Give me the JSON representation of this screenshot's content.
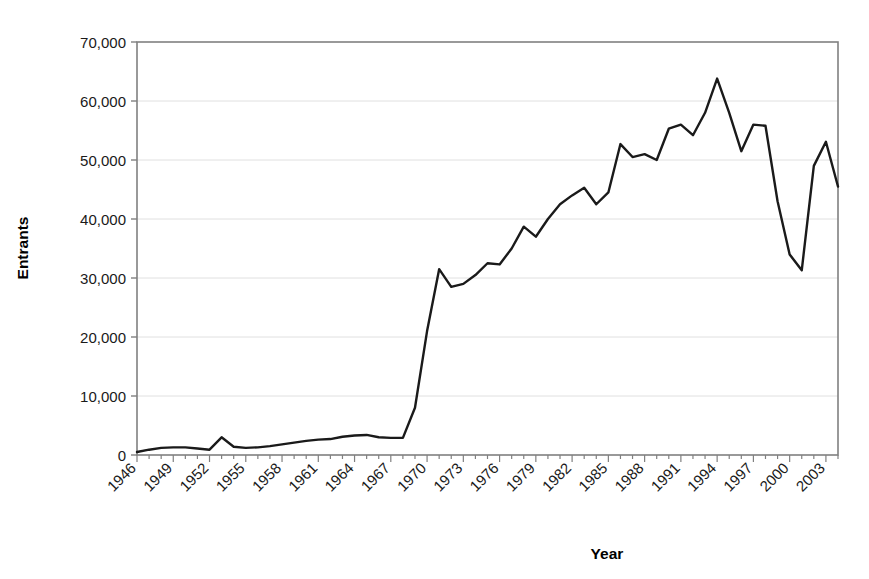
{
  "chart_data": {
    "type": "line",
    "title": "",
    "xlabel": "Year",
    "ylabel": "Entrants",
    "xlim": [
      1946,
      2004
    ],
    "ylim": [
      0,
      70000
    ],
    "grid": "horizontal",
    "legend": "none",
    "ytick_labels": [
      "70,000",
      "60,000",
      "50,000",
      "40,000",
      "30,000",
      "20,000",
      "10,000",
      "0"
    ],
    "ytick_values": [
      70000,
      60000,
      50000,
      40000,
      30000,
      20000,
      10000,
      0
    ],
    "xtick_labels": [
      "1946",
      "1949",
      "1952",
      "1955",
      "1958",
      "1961",
      "1964",
      "1967",
      "1970",
      "1973",
      "1976",
      "1979",
      "1982",
      "1985",
      "1988",
      "1991",
      "1994",
      "1997",
      "2000",
      "2003"
    ],
    "xtick_values": [
      1946,
      1949,
      1952,
      1955,
      1958,
      1961,
      1964,
      1967,
      1970,
      1973,
      1976,
      1979,
      1982,
      1985,
      1988,
      1991,
      1994,
      1997,
      2000,
      2003
    ],
    "x": [
      1946,
      1947,
      1948,
      1949,
      1950,
      1951,
      1952,
      1953,
      1954,
      1955,
      1956,
      1957,
      1958,
      1959,
      1960,
      1961,
      1962,
      1963,
      1964,
      1965,
      1966,
      1967,
      1968,
      1969,
      1970,
      1971,
      1972,
      1973,
      1974,
      1975,
      1976,
      1977,
      1978,
      1979,
      1980,
      1981,
      1982,
      1983,
      1984,
      1985,
      1986,
      1987,
      1988,
      1989,
      1990,
      1991,
      1992,
      1993,
      1994,
      1995,
      1996,
      1997,
      1998,
      1999,
      2000,
      2001,
      2002,
      2003,
      2004
    ],
    "values": [
      500,
      900,
      1200,
      1300,
      1300,
      1100,
      900,
      3000,
      1400,
      1200,
      1300,
      1500,
      1800,
      2100,
      2400,
      2600,
      2700,
      3100,
      3300,
      3400,
      3000,
      2900,
      2900,
      8000,
      21000,
      31500,
      28500,
      29000,
      30500,
      32500,
      32300,
      35000,
      38700,
      37000,
      40000,
      42500,
      44000,
      45300,
      42500,
      44500,
      52700,
      50500,
      51000,
      50000,
      55300,
      56000,
      54200,
      58000,
      63800,
      58000,
      51500,
      56000,
      55800,
      43000,
      34000,
      31300,
      49000,
      53100,
      45500
    ],
    "series_name": "Entrants",
    "line_color": "#1a1a1a",
    "line_width": 2.4,
    "grid_color": "#e0e0e0",
    "axis_color": "#808080",
    "background_color": "#ffffff"
  }
}
